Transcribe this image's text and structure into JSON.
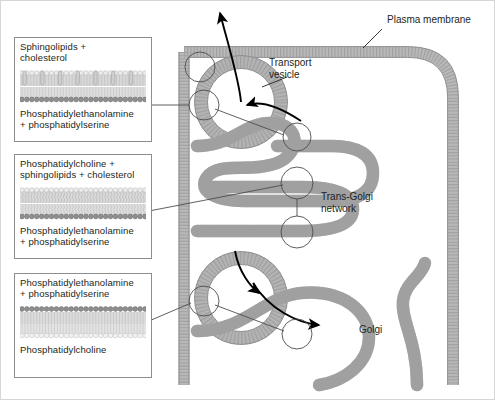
{
  "figure": {
    "background": "#ffffff",
    "border_color": "#d6d6d6"
  },
  "colors": {
    "membrane_fill": "#b3b3b3",
    "membrane_stroke": "#8c8c8c",
    "plasma_membrane_fill": "#b8b8b8",
    "head_dark": "#8a8a8a",
    "head_light": "#e2e2e2",
    "tail": "#c9c9c9",
    "callout_stroke": "#4d4d4d",
    "arrow": "#000000",
    "text": "#231f20",
    "panel_border": "#8d8d8d"
  },
  "panels": [
    {
      "id": "panel-plasma-membrane",
      "top_label": "Sphingolipids +\ncholesterol",
      "top_label_line1": "Sphingolipids +",
      "top_label_line2": "cholesterol",
      "bottom_label_line1": "Phosphatidylethanolamine",
      "bottom_label_line2": "+ phosphatidylserine",
      "leaflet_outer": {
        "head": "light",
        "tails": "straight",
        "cholesterol": true
      },
      "leaflet_inner": {
        "head": "dark",
        "tails": "straight",
        "cholesterol": false
      }
    },
    {
      "id": "panel-trans-golgi-network",
      "top_label_line1": "Phosphatidylcholine +",
      "top_label_line2": "sphingolipids + cholesterol",
      "bottom_label_line1": "Phosphatidylethanolamine",
      "bottom_label_line2": "+ phosphatidylserine",
      "leaflet_outer": {
        "head": "light",
        "tails": "wavy",
        "cholesterol": false
      },
      "leaflet_inner": {
        "head": "dark",
        "tails": "wavy",
        "cholesterol": false
      }
    },
    {
      "id": "panel-golgi",
      "top_label_line1": "Phosphatidylethanolamine",
      "top_label_line2": "+ phosphatidylserine",
      "bottom_label_line1": "Phosphatidylcholine",
      "bottom_label_line2": "",
      "leaflet_outer": {
        "head": "dark",
        "tails": "straight",
        "cholesterol": false
      },
      "leaflet_inner": {
        "head": "light",
        "tails": "straight",
        "cholesterol": false
      }
    }
  ],
  "map_labels": {
    "plasma_membrane": "Plasma membrane",
    "transport_vesicle_line1": "Transport",
    "transport_vesicle_line2": "vesicle",
    "trans_golgi_line1": "Trans-Golgi",
    "trans_golgi_line2": "network",
    "golgi": "Golgi"
  },
  "structures": [
    {
      "name": "plasma-membrane",
      "shape": "rounded-cell-boundary"
    },
    {
      "name": "transport-vesicle-upper",
      "shape": "ring"
    },
    {
      "name": "transport-vesicle-lower",
      "shape": "ring"
    },
    {
      "name": "trans-golgi-network-cisterna",
      "shape": "folded-tube"
    },
    {
      "name": "golgi-cisterna",
      "shape": "folded-tube"
    }
  ],
  "arrows": [
    {
      "name": "vesicle-to-plasma-membrane-arrow",
      "direction": "up-out"
    },
    {
      "name": "tgn-to-vesicle-arrow",
      "direction": "up-left"
    },
    {
      "name": "golgi-to-tgn-arrow",
      "direction": "up-right"
    },
    {
      "name": "golgi-budding-arrow",
      "direction": "down-right"
    }
  ],
  "callouts": [
    {
      "name": "callout-plasma-membrane-top",
      "links_panel": "panel-plasma-membrane"
    },
    {
      "name": "callout-vesicle-upper",
      "links_panel": "panel-plasma-membrane"
    },
    {
      "name": "callout-vesicle-neck",
      "links_panel": "panel-trans-golgi-network"
    },
    {
      "name": "callout-tgn-upper",
      "links_panel": "panel-trans-golgi-network"
    },
    {
      "name": "callout-tgn-lower",
      "links_panel": "panel-trans-golgi-network"
    },
    {
      "name": "callout-vesicle-lower",
      "links_panel": "panel-golgi"
    },
    {
      "name": "callout-golgi",
      "links_panel": "panel-golgi"
    }
  ]
}
